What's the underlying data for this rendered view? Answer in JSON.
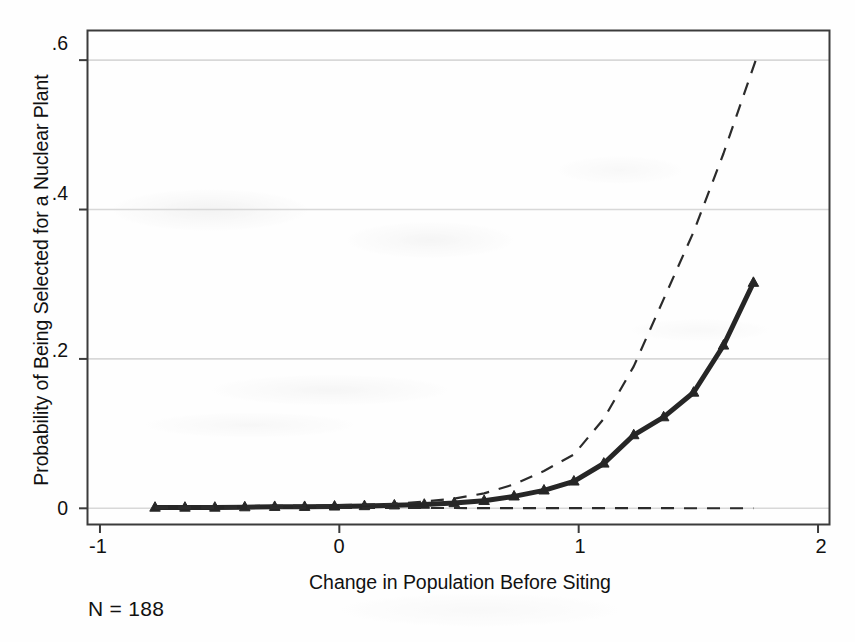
{
  "figure": {
    "background_color": "#fefefe",
    "frame_color": "#3b3b3b",
    "grid_color": "#d8d8d8",
    "series_color": "#262626",
    "ci_color": "#2b2b2b"
  },
  "annotations": {
    "sample_size_note": "N = 188"
  },
  "chart_data": {
    "type": "line",
    "title": "",
    "xlabel": "Change in Population Before Siting",
    "ylabel": "Probability of Being Selected for a Nuclear Plant",
    "xlim": [
      -1.05,
      2.05
    ],
    "ylim": [
      -0.021,
      0.639
    ],
    "xticks": [
      -1,
      0,
      1,
      2
    ],
    "xticklabels": [
      "-1",
      "0",
      "1",
      "2"
    ],
    "yticks": [
      0,
      0.2,
      0.4,
      0.6
    ],
    "yticklabels": [
      "0",
      ".2",
      ".4",
      ".6"
    ],
    "grid": "horizontal",
    "legend": "none",
    "series": [
      {
        "name": "Predicted probability",
        "style": "solid",
        "marker": "triangle",
        "linewidth": 5,
        "x": [
          -0.77,
          -0.645,
          -0.52,
          -0.395,
          -0.27,
          -0.145,
          -0.02,
          0.105,
          0.23,
          0.355,
          0.48,
          0.605,
          0.73,
          0.855,
          0.98,
          1.105,
          1.23,
          1.355,
          1.48,
          1.605,
          1.73
        ],
        "y": [
          0.001,
          0.001,
          0.001,
          0.0015,
          0.002,
          0.002,
          0.0025,
          0.003,
          0.004,
          0.005,
          0.007,
          0.01,
          0.016,
          0.024,
          0.036,
          0.06,
          0.098,
          0.122,
          0.155,
          0.218,
          0.302
        ]
      },
      {
        "name": "Upper 95% confidence bound",
        "style": "dashed",
        "marker": "none",
        "linewidth": 2.2,
        "x": [
          -0.77,
          -0.02,
          0.23,
          0.355,
          0.48,
          0.605,
          0.73,
          0.855,
          0.98,
          1.105,
          1.23,
          1.355,
          1.48,
          1.605,
          1.74
        ],
        "y": [
          0.002,
          0.004,
          0.006,
          0.009,
          0.013,
          0.02,
          0.032,
          0.05,
          0.072,
          0.12,
          0.19,
          0.28,
          0.37,
          0.475,
          0.6
        ]
      },
      {
        "name": "Lower 95% confidence bound",
        "style": "dashed",
        "marker": "none",
        "linewidth": 2.2,
        "x": [
          -0.77,
          0.23,
          0.48,
          0.73,
          0.98,
          1.23,
          1.48,
          1.73
        ],
        "y": [
          0.0005,
          0.0005,
          0.0004,
          0.0003,
          0.0002,
          0.0002,
          0.0001,
          0.0001
        ]
      }
    ]
  }
}
